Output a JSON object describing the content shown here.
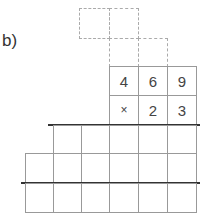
{
  "problem": {
    "label": "b)",
    "multiplicand_digits": [
      "4",
      "6",
      "9"
    ],
    "multiplier_row": [
      "×",
      "2",
      "3"
    ],
    "carry_boxes_row1": 2,
    "carry_boxes_row2": 2,
    "partial_product_row1_cells": 5,
    "partial_product_row2_cells": 6,
    "result_row_cells": 6
  }
}
